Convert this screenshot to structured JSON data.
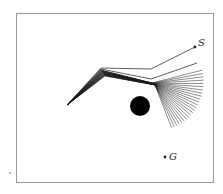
{
  "figure": {
    "frame": {
      "x": 16,
      "y": 13,
      "width": 198,
      "height": 170,
      "stroke": "#9a9a9a"
    },
    "start_label": "S",
    "goal_label": "G",
    "start_point": {
      "x": 195,
      "y": 47
    },
    "goal_point": {
      "x": 165,
      "y": 157
    },
    "obstacle": {
      "cx": 140,
      "cy": 106,
      "r": 10,
      "color": "#000000"
    },
    "stray_dot": {
      "x": 10,
      "y": 173
    },
    "arm": {
      "base": {
        "x": 67,
        "y": 105
      },
      "description": "Sequence of planar 3-link arm configurations moving from start S toward goal G around a circular obstacle",
      "num_configurations": 24
    },
    "colors": {
      "link": "#1a1a1a",
      "frame": "#9a9a9a",
      "background": "#ffffff"
    }
  }
}
